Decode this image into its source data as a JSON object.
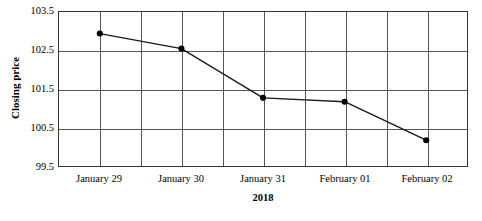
{
  "chart_data": {
    "type": "line",
    "title": "",
    "xlabel": "2018",
    "ylabel": "Closing price",
    "categories": [
      "January 29",
      "January 30",
      "January 31",
      "February 01",
      "February 02"
    ],
    "values": [
      102.94,
      102.55,
      101.27,
      101.17,
      100.17
    ],
    "series": [
      {
        "name": "Closing price",
        "values": [
          102.94,
          102.55,
          101.27,
          101.17,
          100.17
        ]
      }
    ],
    "ylim": [
      99.5,
      103.5
    ],
    "yticks": [
      "103.5",
      "102.5",
      "101.5",
      "100.5",
      "99.5"
    ],
    "ytick_values": [
      103.5,
      102.5,
      101.5,
      100.5,
      99.5
    ],
    "grid": "both",
    "legend": "none",
    "marker": "filled-circle",
    "line_color": "#1a1a1a",
    "marker_color": "#000000",
    "grid_color": "#555555",
    "axis_color": "#333333",
    "background": "#ffffff",
    "x_gridline_count": 11,
    "annotations": []
  }
}
